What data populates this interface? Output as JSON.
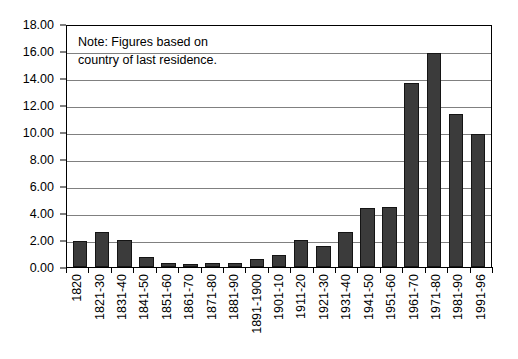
{
  "chart_data": {
    "type": "bar",
    "title": "",
    "subtitle": "",
    "xlabel": "",
    "ylabel": "",
    "ylim": [
      0,
      18
    ],
    "ytick_step": 2,
    "grid": true,
    "legend": null,
    "annotations": [
      "Note: Figures based on\ncountry of last residence."
    ],
    "ytick_labels": [
      "18.00",
      "16.00",
      "14.00",
      "12.00",
      "10.00",
      "8.00",
      "6.00",
      "4.00",
      "2.00",
      "0.00"
    ],
    "categories": [
      "1820",
      "1821-30",
      "1831-40",
      "1841-50",
      "1851-60",
      "1861-70",
      "1871-80",
      "1881-90",
      "1891-1900",
      "1901-10",
      "1911-20",
      "1921-30",
      "1931-40",
      "1941-50",
      "1951-60",
      "1961-70",
      "1971-80",
      "1981-90",
      "1991-96"
    ],
    "values": [
      1.95,
      2.6,
      2.0,
      0.75,
      0.28,
      0.25,
      0.3,
      0.33,
      0.6,
      0.9,
      2.0,
      1.6,
      2.6,
      4.4,
      4.45,
      13.75,
      16.0,
      11.4,
      9.9
    ],
    "colors": {
      "bar_fill": "#3b3b3b",
      "bar_border": "#141414",
      "gridline": "#808080",
      "axis": "#000000",
      "background": "#ffffff",
      "text": "#000000"
    }
  }
}
